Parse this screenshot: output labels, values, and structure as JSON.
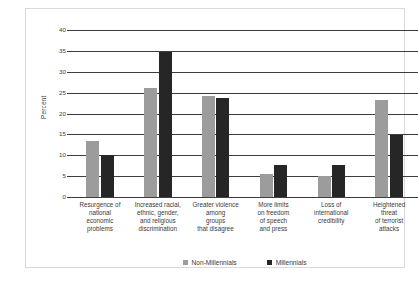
{
  "chart_data": {
    "type": "bar",
    "title": "",
    "xlabel": "",
    "ylabel": "Percent",
    "ylim": [
      0,
      40
    ],
    "yticks": [
      0,
      5,
      10,
      15,
      20,
      25,
      30,
      35,
      40
    ],
    "grid": true,
    "legend_position": "bottom",
    "categories": [
      "Resurgence of national economic problems",
      "Increased racial, ethnic, gender, and religious discrimination",
      "Greater violence among groups that disagree",
      "More limits on freedom of speech and press",
      "Loss of international credibility",
      "Heightened threat of terrorist attacks"
    ],
    "category_lines": [
      [
        "Resurgence of",
        "national",
        "economic",
        "problems"
      ],
      [
        "Increased racial,",
        "ethnic, gender,",
        "and religious",
        "discrimination"
      ],
      [
        "Greater violence",
        "among",
        "groups",
        "that disagree"
      ],
      [
        "More limits",
        "on freedom",
        "of speech",
        "and press"
      ],
      [
        "Loss of",
        "international",
        "credibility"
      ],
      [
        "Heightened",
        "threat",
        "of terrorist",
        "attacks"
      ]
    ],
    "series": [
      {
        "name": "Non-Millennials",
        "color": "#9c9c9c",
        "values": [
          13.4,
          26.1,
          24.3,
          5.5,
          5.1,
          23.2
        ]
      },
      {
        "name": "Millennials",
        "color": "#262626",
        "values": [
          10.0,
          34.8,
          23.8,
          7.6,
          7.6,
          14.8
        ]
      }
    ]
  },
  "colors": {
    "non_millennials": "#9c9c9c",
    "millennials": "#262626",
    "gridline": "#3d3d3d",
    "frame": "#d9d9d9",
    "text": "#3a3a3a",
    "background": "#ffffff"
  }
}
